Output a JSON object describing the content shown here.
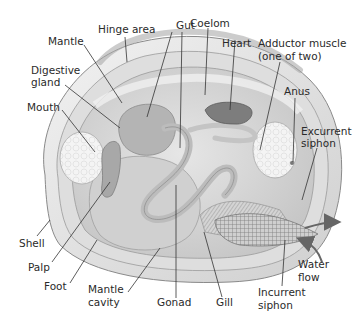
{
  "diagram": {
    "labels": {
      "hinge_area": "Hinge area",
      "mantle": "Mantle",
      "digestive_gland_1": "Digestive",
      "digestive_gland_2": "gland",
      "mouth": "Mouth",
      "gut": "Gut",
      "coelom": "Coelom",
      "heart": "Heart",
      "adductor_1": "Adductor muscle",
      "adductor_2": "(one of two)",
      "anus": "Anus",
      "excurrent_1": "Excurrent",
      "excurrent_2": "siphon",
      "shell": "Shell",
      "palp": "Palp",
      "foot": "Foot",
      "mantle_cavity_1": "Mantle",
      "mantle_cavity_2": "cavity",
      "gonad": "Gonad",
      "gill": "Gill",
      "water_flow_1": "Water",
      "water_flow_2": "flow",
      "incurrent_1": "Incurrent",
      "incurrent_2": "siphon"
    }
  }
}
